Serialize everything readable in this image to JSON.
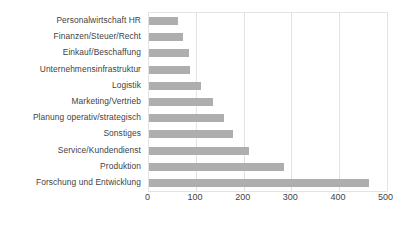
{
  "chart_data": {
    "type": "bar",
    "orientation": "horizontal",
    "title": "",
    "subtitle": "",
    "xlabel": "",
    "ylabel": "",
    "xlim": [
      0,
      500
    ],
    "xticks": [
      0,
      100,
      200,
      300,
      400,
      500
    ],
    "grid": true,
    "legend": false,
    "bar_color": "#aeaeae",
    "plot_border_color": "#e3e3e3",
    "text_color": "#3f3f3f",
    "categories": [
      "Personalwirtschaft HR",
      "Finanzen/Steuer/Recht",
      "Einkauf/Beschaffung",
      "Unternehmensinfrastruktur",
      "Logistik",
      "Marketing/Vertrieb",
      "Planung operativ/strategisch",
      "Sonstiges",
      "Service/Kundendienst",
      "Produktion",
      "Forschung und Entwicklung"
    ],
    "values": [
      62,
      73,
      86,
      88,
      110,
      135,
      158,
      178,
      212,
      285,
      463
    ]
  }
}
